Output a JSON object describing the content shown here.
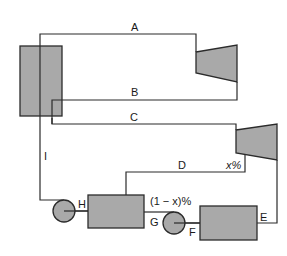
{
  "diagram": {
    "type": "steam power cycle with open feedwater heater",
    "colors": {
      "component_fill": "#a9a9a9",
      "line": "#2b2b2b",
      "background": "#ffffff"
    },
    "components": [
      {
        "id": "boiler",
        "shape": "rectangle"
      },
      {
        "id": "high-pressure-turbine",
        "shape": "trapezoid"
      },
      {
        "id": "low-pressure-turbine",
        "shape": "trapezoid"
      },
      {
        "id": "feedwater-heater",
        "shape": "rectangle"
      },
      {
        "id": "condenser",
        "shape": "rectangle"
      },
      {
        "id": "pump-1",
        "shape": "circle"
      },
      {
        "id": "pump-2",
        "shape": "circle"
      }
    ],
    "labels": {
      "A": "A",
      "B": "B",
      "C": "C",
      "D": "D",
      "E": "E",
      "F": "F",
      "G": "G",
      "H": "H",
      "I": "I",
      "extraction_fraction": "x%",
      "remaining_fraction": "(1 − x)%"
    }
  }
}
